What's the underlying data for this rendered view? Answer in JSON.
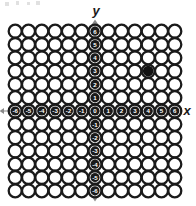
{
  "figure": {
    "title": "",
    "axis_labels": {
      "x": "x",
      "y": "y"
    },
    "colors": {
      "ink": "#1a1a1a",
      "circle_fill": "#ffffff",
      "marked_fill": "#111111",
      "background": "#ffffff",
      "axis_line": "#8a8a8a",
      "label_text": "#ffffff"
    }
  },
  "chart_data": {
    "type": "scatter",
    "title": "",
    "xlabel": "x",
    "ylabel": "y",
    "xlim": [
      -6,
      6
    ],
    "ylim": [
      -6,
      6
    ],
    "grid": true,
    "x_tick_labels": [
      "-6",
      "-5",
      "-4",
      "-3",
      "-2",
      "-1",
      "0",
      "1",
      "2",
      "3",
      "4",
      "5",
      "6"
    ],
    "y_tick_labels": [
      "6",
      "5",
      "4",
      "3",
      "2",
      "1",
      "0",
      "-1",
      "-2",
      "-3",
      "-4",
      "-5",
      "-6"
    ],
    "x_ticks": [
      -6,
      -5,
      -4,
      -3,
      -2,
      -1,
      0,
      1,
      2,
      3,
      4,
      5,
      6
    ],
    "y_ticks": [
      6,
      5,
      4,
      3,
      2,
      1,
      0,
      -1,
      -2,
      -3,
      -4,
      -5,
      -6
    ],
    "lattice": {
      "rows": 13,
      "cols": 13,
      "marker": "open-circle"
    },
    "series": [
      {
        "name": "marked point",
        "marker": "filled-circle",
        "points": [
          {
            "x": 4,
            "y": 3,
            "label": ""
          }
        ]
      }
    ],
    "legend": null,
    "annotations": []
  },
  "geometry": {
    "origin_px": {
      "x": 95,
      "y": 111
    },
    "step_px": 13.3,
    "circle_outer_r": 6.5,
    "circle_inner_r": 4.3,
    "label_radius": 4.6
  },
  "artifacts": [
    {
      "name": "scan-speck-1",
      "x": 5,
      "y": 2,
      "w": 4,
      "h": 4
    },
    {
      "name": "scan-speck-2",
      "x": 16,
      "y": 1,
      "w": 3,
      "h": 4
    },
    {
      "name": "scan-speck-3",
      "x": 27,
      "y": 2,
      "w": 3,
      "h": 3
    },
    {
      "name": "scan-speck-4",
      "x": 36,
      "y": 1,
      "w": 4,
      "h": 4
    }
  ]
}
